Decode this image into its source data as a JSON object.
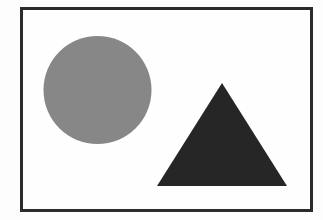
{
  "figure": {
    "background_color": "#ffffff",
    "outer_background_color": "#fdfdfd",
    "border": {
      "color": "#2b2b2b",
      "width_px": 3,
      "x": 20,
      "y": 7,
      "width": 293,
      "height": 205
    },
    "shapes": [
      {
        "name": "circle",
        "label": "Gray Circle",
        "fill": "#878787",
        "center_x": 97.5,
        "center_y": 90,
        "radius": 54,
        "diameter": 108
      },
      {
        "name": "triangle",
        "label": "Dark Triangle",
        "fill": "#262626",
        "apex_x": 222,
        "apex_y": 83,
        "base_left_x": 157,
        "base_left_y": 186,
        "base_right_x": 287,
        "base_right_y": 186,
        "base_width": 130,
        "height": 103
      }
    ]
  }
}
